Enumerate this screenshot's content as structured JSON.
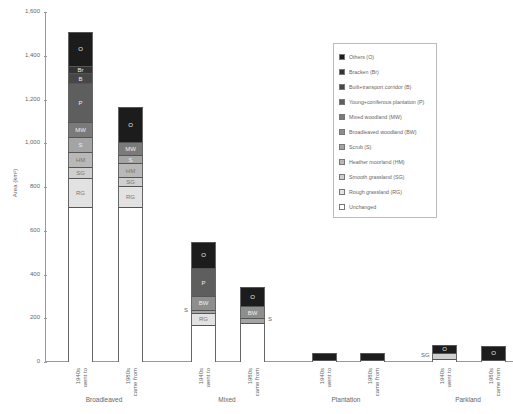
{
  "chart_data": {
    "type": "bar",
    "stacked": true,
    "title": "",
    "xlabel": "",
    "ylabel": "Area (km²)",
    "ylim": [
      0,
      1600
    ],
    "yticks": [
      "0",
      "200",
      "400",
      "600",
      "800",
      "1,000",
      "1,200",
      "1,400",
      "1,600"
    ],
    "grid": false,
    "legend_position": "upper right (inside)",
    "groups": [
      "Broadleaved",
      "Mixed",
      "Plantation",
      "Parkland"
    ],
    "categories": [
      "Broadleaved 1940s went to",
      "Broadleaved 1980s came from",
      "Mixed 1940s went to",
      "Mixed 1980s came from",
      "Plantation 1940s went to",
      "Plantation 1980s came from",
      "Parkland 1940s went to",
      "Parkland 1980s came from"
    ],
    "bar_labels": [
      "1940s\nwent to",
      "1980s\ncame from"
    ],
    "series": [
      {
        "name": "Unchanged",
        "code": "",
        "color": "#ffffff",
        "values": [
          710,
          710,
          170,
          180,
          10,
          10,
          15,
          10
        ]
      },
      {
        "name": "Rough grassland (RG)",
        "code": "RG",
        "color": "#e2e2e2",
        "values": [
          130,
          95,
          55,
          0,
          0,
          0,
          0,
          0
        ]
      },
      {
        "name": "Smooth grassland (SG)",
        "code": "SG",
        "color": "#cfcfcf",
        "values": [
          50,
          40,
          0,
          0,
          0,
          0,
          25,
          0
        ]
      },
      {
        "name": "Heather moorland (HM)",
        "code": "HM",
        "color": "#b8b8b8",
        "values": [
          70,
          65,
          0,
          0,
          0,
          0,
          0,
          0
        ]
      },
      {
        "name": "Scrub (S)",
        "code": "S",
        "color": "#a4a4a4",
        "values": [
          70,
          35,
          15,
          20,
          0,
          0,
          0,
          0
        ]
      },
      {
        "name": "Broadleaved woodland (BW)",
        "code": "BW",
        "color": "#8e8e8e",
        "values": [
          0,
          0,
          60,
          55,
          0,
          0,
          0,
          0
        ]
      },
      {
        "name": "Mixed woodland (MW)",
        "code": "MW",
        "color": "#7a7a7a",
        "values": [
          65,
          60,
          0,
          0,
          0,
          0,
          0,
          0
        ]
      },
      {
        "name": "Young+coniferous plantation (P)",
        "code": "P",
        "color": "#5e5e5e",
        "values": [
          180,
          0,
          130,
          0,
          0,
          0,
          0,
          0
        ]
      },
      {
        "name": "Built+transport corridor (B)",
        "code": "B",
        "color": "#474747",
        "values": [
          45,
          0,
          0,
          0,
          0,
          0,
          0,
          0
        ]
      },
      {
        "name": "Bracken (Br)",
        "code": "Br",
        "color": "#333333",
        "values": [
          35,
          0,
          0,
          0,
          0,
          0,
          0,
          0
        ]
      },
      {
        "name": "Others (O)",
        "code": "O",
        "color": "#1c1c1c",
        "values": [
          155,
          160,
          120,
          90,
          30,
          30,
          40,
          65
        ]
      }
    ],
    "outside_labels": [
      {
        "bar": 2,
        "text": "S",
        "side": "left"
      },
      {
        "bar": 3,
        "text": "S",
        "side": "right"
      },
      {
        "bar": 6,
        "text": "SG",
        "side": "left"
      }
    ]
  },
  "legend": [
    {
      "label": "Others (O)",
      "color": "#1c1c1c"
    },
    {
      "label": "Bracken (Br)",
      "color": "#333333"
    },
    {
      "label": "Built+transport corridor (B)",
      "color": "#474747"
    },
    {
      "label": "Young+coniferous plantation (P)",
      "color": "#5e5e5e"
    },
    {
      "label": "Mixed woodland (MW)",
      "color": "#7a7a7a"
    },
    {
      "label": "Broadleaved woodland (BW)",
      "color": "#8e8e8e"
    },
    {
      "label": "Scrub (S)",
      "color": "#a4a4a4"
    },
    {
      "label": "Heather moorland (HM)",
      "color": "#b8b8b8"
    },
    {
      "label": "Smooth grassland (SG)",
      "color": "#cfcfcf"
    },
    {
      "label": "Rough grassland (RG)",
      "color": "#e2e2e2"
    },
    {
      "label": "Unchanged",
      "color": "#ffffff"
    }
  ],
  "axis": {
    "ylabel": "Area (km²)"
  }
}
